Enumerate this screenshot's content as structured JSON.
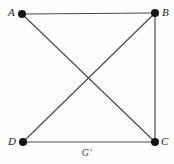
{
  "figure": {
    "caption": "G′",
    "background_color": "#fefefe",
    "edge_color": "#4a4a4a",
    "vertex_color": "#141414",
    "label_color": "#1a1a1a"
  },
  "graph": {
    "vertices": [
      {
        "id": "A",
        "label": "A",
        "x": 22,
        "y": 14,
        "label_x": 8,
        "label_y": 7
      },
      {
        "id": "B",
        "label": "B",
        "x": 155,
        "y": 13,
        "label_x": 162,
        "label_y": 7
      },
      {
        "id": "C",
        "label": "C",
        "x": 155,
        "y": 142,
        "label_x": 161,
        "label_y": 136
      },
      {
        "id": "D",
        "label": "D",
        "x": 23,
        "y": 142,
        "label_x": 8,
        "label_y": 136
      }
    ],
    "edges": [
      {
        "from": "A",
        "to": "B",
        "name": "edge-a-b"
      },
      {
        "from": "B",
        "to": "C",
        "name": "edge-b-c"
      },
      {
        "from": "D",
        "to": "C",
        "name": "edge-d-c"
      },
      {
        "from": "A",
        "to": "C",
        "name": "edge-a-c"
      },
      {
        "from": "B",
        "to": "D",
        "name": "edge-b-d"
      }
    ],
    "vertex_radius": 4,
    "edge_width": 1.2
  }
}
